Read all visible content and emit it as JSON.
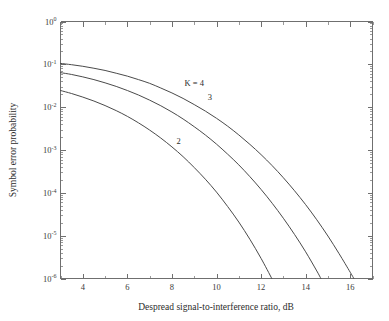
{
  "chart_data": {
    "type": "line",
    "title": "",
    "xlabel": "Despread signal-to-interference ratio, dB",
    "ylabel": "Symbol error probability",
    "xscale": "linear",
    "yscale": "log",
    "xlim": [
      3,
      17
    ],
    "ylim": [
      1e-06,
      1
    ],
    "grid": false,
    "legend_position": "inline-curve-labels",
    "xticks": [
      4,
      6,
      8,
      10,
      12,
      14,
      16
    ],
    "xtick_labels": [
      "4",
      "6",
      "8",
      "10",
      "12",
      "14",
      "16"
    ],
    "xminor_step": 1,
    "yticks": [
      1,
      0.1,
      0.01,
      0.001,
      0.0001,
      1e-05,
      1e-06
    ],
    "ytick_labels": [
      "10",
      "10",
      "10",
      "10",
      "10",
      "10",
      "10"
    ],
    "ytick_exponents": [
      "0",
      "-1",
      "-2",
      "-3",
      "-4",
      "-5",
      "-6"
    ],
    "series": [
      {
        "name": "K = 4",
        "label": "K = 4",
        "label_x": 9.0,
        "label_y": 0.031,
        "color": "#4a4a4a",
        "x": [
          3,
          3.5,
          4,
          4.5,
          5,
          5.5,
          6,
          6.5,
          7,
          7.5,
          8,
          8.5,
          9,
          9.5,
          10,
          10.5,
          11,
          11.5,
          12,
          12.5,
          13,
          13.5,
          14,
          14.5,
          15,
          15.5,
          16,
          16.5,
          17
        ],
        "y": [
          0.105,
          0.098,
          0.09,
          0.081,
          0.072,
          0.062,
          0.053,
          0.044,
          0.036,
          0.028,
          0.0215,
          0.016,
          0.0115,
          0.0081,
          0.0055,
          0.0036,
          0.00225,
          0.00135,
          0.00078,
          0.00043,
          0.000225,
          0.000112,
          5.3e-05,
          2.35e-05,
          9.8e-06,
          3.8e-06,
          1.4e-06,
          5e-07,
          1.7e-07
        ]
      },
      {
        "name": "3",
        "label": "3",
        "label_x": 9.7,
        "label_y": 0.0145,
        "color": "#4a4a4a",
        "x": [
          3,
          3.5,
          4,
          4.5,
          5,
          5.5,
          6,
          6.5,
          7,
          7.5,
          8,
          8.5,
          9,
          9.5,
          10,
          10.5,
          11,
          11.5,
          12,
          12.5,
          13,
          13.5,
          14,
          14.5,
          15,
          15.5,
          16,
          16.5,
          17
        ],
        "y": [
          0.064,
          0.058,
          0.051,
          0.044,
          0.037,
          0.0305,
          0.0245,
          0.0192,
          0.0146,
          0.0108,
          0.0077,
          0.0053,
          0.0035,
          0.00224,
          0.00137,
          0.0008,
          0.00045,
          0.000238,
          0.00012,
          5.7e-05,
          2.55e-05,
          1.07e-05,
          4.2e-06,
          1.5e-06,
          5e-07,
          1.5e-07,
          4e-08,
          9.5e-09,
          2e-09
        ]
      },
      {
        "name": "2",
        "label": "2",
        "label_x": 8.3,
        "label_y": 0.0014,
        "color": "#4a4a4a",
        "x": [
          3,
          3.5,
          4,
          4.5,
          5,
          5.5,
          6,
          6.5,
          7,
          7.5,
          8,
          8.5,
          9,
          9.5,
          10,
          10.5,
          11,
          11.5,
          12,
          12.5,
          13,
          13.5,
          14,
          14.5
        ],
        "y": [
          0.0245,
          0.0208,
          0.0172,
          0.0139,
          0.0109,
          0.0083,
          0.0061,
          0.0043,
          0.00292,
          0.0019,
          0.00118,
          0.0007,
          0.00039,
          0.000208,
          0.000104,
          4.8e-05,
          2.08e-05,
          8.2e-06,
          2.95e-06,
          9.6e-07,
          2.8e-07,
          7e-08,
          1.6e-08,
          3e-09
        ]
      }
    ]
  },
  "figure": {
    "xlabel": "Despread signal-to-interference ratio, dB",
    "ylabel": "Symbol error probability",
    "base": "10"
  }
}
